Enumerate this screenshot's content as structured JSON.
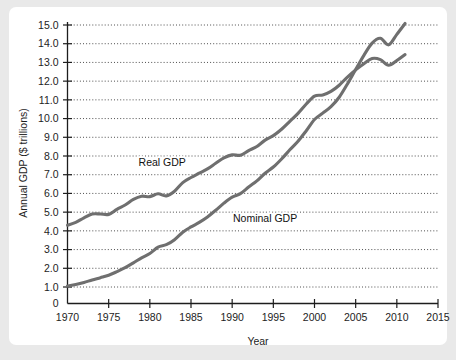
{
  "canvas": {
    "outer_background": "#e9e9e9",
    "card_background": "#ffffff"
  },
  "chart_data": {
    "type": "line",
    "title": "",
    "xlabel": "Year",
    "ylabel": "Annual GDP ($ trillions)",
    "xlim": [
      1970,
      2015
    ],
    "ylim": [
      0,
      15.0
    ],
    "grid": true,
    "legend_position": "inline-annotations",
    "x_ticks": [
      "1970",
      "1975",
      "1980",
      "1985",
      "1990",
      "1995",
      "2000",
      "2005",
      "2010",
      "2015"
    ],
    "y_ticks": [
      "0",
      "1.0",
      "2.0",
      "3.0",
      "4.0",
      "5.0",
      "6.0",
      "7.0",
      "8.0",
      "9.0",
      "10.0",
      "11.0",
      "12.0",
      "13.0",
      "14.0",
      "15.0"
    ],
    "line_color": "#6f6f6f",
    "x": [
      1970,
      1971,
      1972,
      1973,
      1974,
      1975,
      1976,
      1977,
      1978,
      1979,
      1980,
      1981,
      1982,
      1983,
      1984,
      1985,
      1986,
      1987,
      1988,
      1989,
      1990,
      1991,
      1992,
      1993,
      1994,
      1995,
      1996,
      1997,
      1998,
      1999,
      2000,
      2001,
      2002,
      2003,
      2004,
      2005,
      2006,
      2007,
      2008,
      2009,
      2010,
      2011
    ],
    "series": [
      {
        "name": "Real GDP",
        "label": "Real GDP",
        "label_x": 1981.5,
        "label_y": 7.45,
        "values": [
          4.3,
          4.45,
          4.7,
          4.9,
          4.9,
          4.88,
          5.15,
          5.38,
          5.68,
          5.85,
          5.83,
          5.98,
          5.87,
          6.12,
          6.58,
          6.85,
          7.08,
          7.31,
          7.61,
          7.9,
          8.06,
          8.04,
          8.29,
          8.51,
          8.85,
          9.09,
          9.43,
          9.85,
          10.28,
          10.78,
          11.2,
          11.26,
          11.45,
          11.78,
          12.22,
          12.6,
          12.93,
          13.21,
          13.15,
          12.85,
          13.1,
          13.42
        ]
      },
      {
        "name": "Nominal GDP",
        "label": "Nominal GDP",
        "label_x": 1994.0,
        "label_y": 4.5,
        "values": [
          1.05,
          1.13,
          1.24,
          1.38,
          1.5,
          1.63,
          1.82,
          2.03,
          2.29,
          2.56,
          2.79,
          3.13,
          3.26,
          3.53,
          3.93,
          4.21,
          4.45,
          4.74,
          5.1,
          5.48,
          5.8,
          5.99,
          6.34,
          6.67,
          7.08,
          7.41,
          7.84,
          8.33,
          8.79,
          9.35,
          9.95,
          10.29,
          10.64,
          11.14,
          11.85,
          12.62,
          13.38,
          14.03,
          14.29,
          13.94,
          14.5,
          15.08
        ]
      }
    ]
  }
}
